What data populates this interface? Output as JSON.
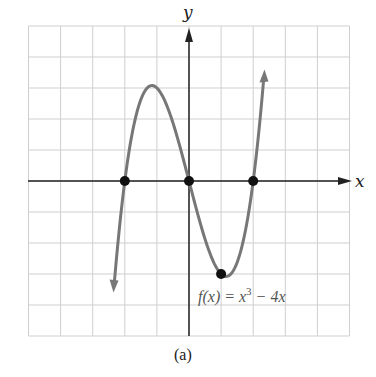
{
  "chart_data": {
    "type": "line",
    "title": "",
    "caption": "(a)",
    "xlabel": "x",
    "ylabel": "y",
    "xlim": [
      -5,
      5
    ],
    "ylim": [
      -5,
      5
    ],
    "grid": true,
    "series": [
      {
        "name": "f(x) = x^3 - 4x",
        "label_main": "f(x) = x",
        "label_exp": "3",
        "label_tail": " − 4x",
        "color": "#777777",
        "x": [
          -2.5,
          -2,
          -1.5,
          -1.155,
          -1,
          -0.5,
          0,
          0.5,
          1,
          1.155,
          1.5,
          2,
          2.5
        ],
        "y": [
          -5.625,
          0,
          2.625,
          3.079,
          3,
          1.875,
          0,
          -1.875,
          -3,
          -3.079,
          -2.625,
          0,
          5.625
        ]
      }
    ],
    "marked_points": [
      {
        "x": -2,
        "y": 0
      },
      {
        "x": 0,
        "y": 0
      },
      {
        "x": 2,
        "y": 0
      },
      {
        "x": 1,
        "y": -3
      }
    ]
  }
}
